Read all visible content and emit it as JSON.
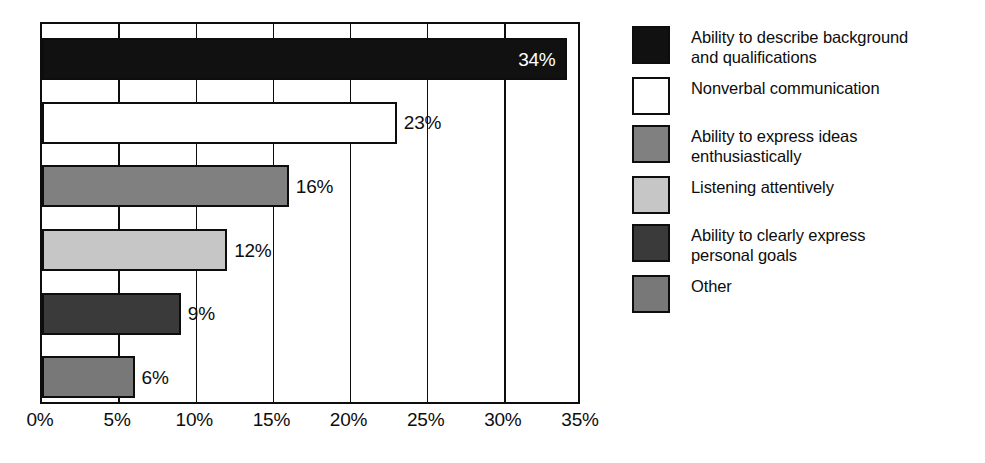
{
  "chart_data": {
    "type": "bar",
    "orientation": "horizontal",
    "title": "",
    "subtitle": "",
    "xlabel": "",
    "ylabel": "",
    "xlim": [
      0,
      35
    ],
    "grid": true,
    "legend_position": "right",
    "categories": [
      "Ability to describe background and qualifications",
      "Nonverbal communication",
      "Ability to express ideas enthusiastically",
      "Listening attentively",
      "Ability to clearly express personal goals",
      "Other"
    ],
    "values": [
      34,
      23,
      16,
      12,
      9,
      6
    ],
    "value_labels": [
      "34%",
      "23%",
      "16%",
      "12%",
      "9%",
      "6%"
    ],
    "tick_labels": [
      "0%",
      "5%",
      "10%",
      "15%",
      "20%",
      "25%",
      "30%",
      "35%"
    ],
    "tick_values": [
      0,
      5,
      10,
      15,
      20,
      25,
      30,
      35
    ],
    "bars": [
      {
        "label": "34%",
        "value": 34,
        "fill": "#111111",
        "label_color": "#ffffff",
        "label_placement": "inside"
      },
      {
        "label": "23%",
        "value": 23,
        "fill": "#ffffff",
        "label_color": "#0d0d0d",
        "label_placement": "outside"
      },
      {
        "label": "16%",
        "value": 16,
        "fill": "#808080",
        "label_color": "#0d0d0d",
        "label_placement": "outside"
      },
      {
        "label": "12%",
        "value": 12,
        "fill": "#c6c6c6",
        "label_color": "#0d0d0d",
        "label_placement": "outside"
      },
      {
        "label": "9%",
        "value": 9,
        "fill": "#3a3a3a",
        "label_color": "#0d0d0d",
        "label_placement": "outside"
      },
      {
        "label": "6%",
        "value": 6,
        "fill": "#787878",
        "label_color": "#0d0d0d",
        "label_placement": "outside"
      }
    ]
  },
  "legend": {
    "items": [
      {
        "label": "Ability to describe background\nand qualifications",
        "color": "#111111"
      },
      {
        "label": "Nonverbal communication",
        "color": "#ffffff"
      },
      {
        "label": "Ability to express ideas\nenthusiastically",
        "color": "#808080"
      },
      {
        "label": "Listening attentively",
        "color": "#c6c6c6"
      },
      {
        "label": "Ability to clearly express\npersonal goals",
        "color": "#3a3a3a"
      },
      {
        "label": "Other",
        "color": "#787878"
      }
    ]
  },
  "colors": {
    "axis": "#0d0d0d",
    "background": "#ffffff",
    "text": "#0d0d0d"
  }
}
